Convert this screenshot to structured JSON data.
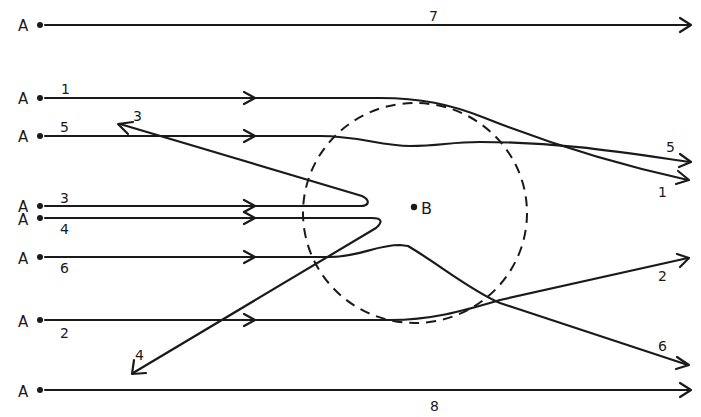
{
  "diagram": {
    "title": "",
    "source_label": "A",
    "target_label": "B",
    "colors": {
      "stroke": "#1a1a1a",
      "background": "#ffffff"
    },
    "sources": [
      {
        "id": "7",
        "label": "A",
        "y": 25
      },
      {
        "id": "1",
        "label": "A",
        "y": 97
      },
      {
        "id": "5",
        "label": "A",
        "y": 135
      },
      {
        "id": "3",
        "label": "A",
        "y": 205
      },
      {
        "id": "4",
        "label": "A",
        "y": 218
      },
      {
        "id": "6",
        "label": "A",
        "y": 257
      },
      {
        "id": "2",
        "label": "A",
        "y": 320
      },
      {
        "id": "8",
        "label": "A",
        "y": 390
      }
    ],
    "paths": [
      {
        "id": "7",
        "label": "7",
        "description": "passes straight, undeflected"
      },
      {
        "id": "1",
        "label": "1",
        "description": "deflected slightly downward"
      },
      {
        "id": "5",
        "label": "5",
        "description": "deflected slightly, wavy path"
      },
      {
        "id": "3",
        "label": "3",
        "description": "reflected back up-left"
      },
      {
        "id": "4",
        "label": "4",
        "description": "reflected back down-left"
      },
      {
        "id": "6",
        "label": "6",
        "description": "deflected downward"
      },
      {
        "id": "2",
        "label": "2",
        "description": "deflected upward"
      },
      {
        "id": "8",
        "label": "8",
        "description": "passes straight, undeflected"
      }
    ],
    "region": {
      "type": "dashed-circle",
      "center_label": "B"
    }
  }
}
